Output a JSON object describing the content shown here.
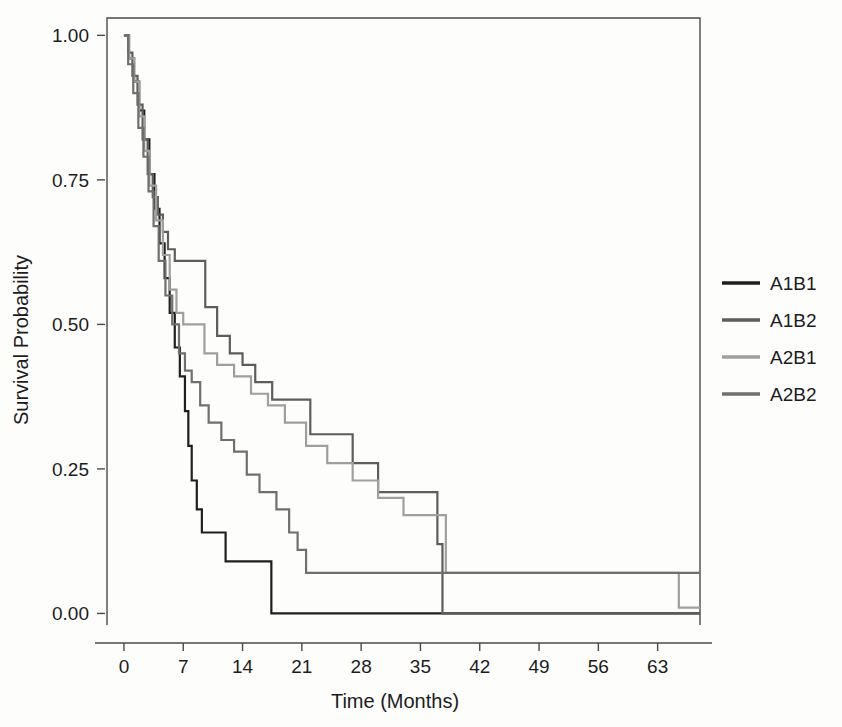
{
  "chart_data": {
    "type": "line",
    "subtype": "kaplan-meier-step",
    "title": "",
    "xlabel": "Time (Months)",
    "ylabel": "Survival Probability",
    "xlim": [
      -2,
      68
    ],
    "ylim": [
      -0.02,
      1.03
    ],
    "xticks": [
      0,
      7,
      14,
      21,
      28,
      35,
      42,
      49,
      56,
      63
    ],
    "yticks": [
      0.0,
      0.25,
      0.5,
      0.75,
      1.0
    ],
    "ytick_labels": [
      "0.00",
      "0.25",
      "0.50",
      "0.75",
      "1.00"
    ],
    "xtick_labels": [
      "0",
      "7",
      "14",
      "21",
      "28",
      "35",
      "42",
      "49",
      "56",
      "63"
    ],
    "grid": false,
    "legend_position": "right",
    "series": [
      {
        "name": "A1B1",
        "color": "#1f1f1f",
        "points": [
          [
            0,
            1.0
          ],
          [
            0.6,
            0.96
          ],
          [
            1.2,
            0.92
          ],
          [
            1.8,
            0.87
          ],
          [
            2.4,
            0.82
          ],
          [
            3.0,
            0.76
          ],
          [
            3.6,
            0.7
          ],
          [
            4.2,
            0.64
          ],
          [
            4.8,
            0.58
          ],
          [
            5.4,
            0.52
          ],
          [
            6.0,
            0.46
          ],
          [
            6.6,
            0.41
          ],
          [
            7.2,
            0.35
          ],
          [
            7.6,
            0.29
          ],
          [
            8.0,
            0.23
          ],
          [
            8.6,
            0.18
          ],
          [
            9.2,
            0.14
          ],
          [
            11.5,
            0.14
          ],
          [
            12.0,
            0.09
          ],
          [
            17.0,
            0.09
          ],
          [
            17.4,
            0.0
          ],
          [
            68,
            0.0
          ]
        ]
      },
      {
        "name": "A1B2",
        "color": "#5d5d5d",
        "points": [
          [
            0,
            1.0
          ],
          [
            0.5,
            0.97
          ],
          [
            1.0,
            0.93
          ],
          [
            1.6,
            0.88
          ],
          [
            2.2,
            0.82
          ],
          [
            2.8,
            0.76
          ],
          [
            3.4,
            0.72
          ],
          [
            4.0,
            0.69
          ],
          [
            4.6,
            0.66
          ],
          [
            5.2,
            0.63
          ],
          [
            6.0,
            0.61
          ],
          [
            9.0,
            0.61
          ],
          [
            9.6,
            0.53
          ],
          [
            11.0,
            0.48
          ],
          [
            12.5,
            0.45
          ],
          [
            14.0,
            0.43
          ],
          [
            15.5,
            0.4
          ],
          [
            17.5,
            0.37
          ],
          [
            21.0,
            0.37
          ],
          [
            22.0,
            0.31
          ],
          [
            26.0,
            0.31
          ],
          [
            27.0,
            0.26
          ],
          [
            30.0,
            0.21
          ],
          [
            36.5,
            0.21
          ],
          [
            37.0,
            0.12
          ],
          [
            37.6,
            0.0
          ],
          [
            68,
            0.0
          ]
        ]
      },
      {
        "name": "A2B1",
        "color": "#9f9f9f",
        "points": [
          [
            0,
            1.0
          ],
          [
            0.6,
            0.96
          ],
          [
            1.2,
            0.92
          ],
          [
            1.8,
            0.86
          ],
          [
            2.4,
            0.8
          ],
          [
            3.0,
            0.74
          ],
          [
            3.8,
            0.68
          ],
          [
            4.6,
            0.62
          ],
          [
            5.4,
            0.56
          ],
          [
            6.2,
            0.52
          ],
          [
            7.0,
            0.5
          ],
          [
            8.5,
            0.5
          ],
          [
            9.5,
            0.45
          ],
          [
            11.0,
            0.43
          ],
          [
            13.0,
            0.41
          ],
          [
            15.0,
            0.38
          ],
          [
            17.0,
            0.36
          ],
          [
            19.0,
            0.33
          ],
          [
            21.5,
            0.29
          ],
          [
            24.0,
            0.26
          ],
          [
            27.0,
            0.23
          ],
          [
            30.0,
            0.2
          ],
          [
            33.0,
            0.17
          ],
          [
            37.5,
            0.17
          ],
          [
            38.0,
            0.07
          ],
          [
            65.0,
            0.07
          ],
          [
            65.5,
            0.01
          ],
          [
            68,
            0.01
          ]
        ]
      },
      {
        "name": "A2B2",
        "color": "#6f6f6f",
        "points": [
          [
            0,
            1.0
          ],
          [
            0.5,
            0.95
          ],
          [
            1.1,
            0.9
          ],
          [
            1.7,
            0.84
          ],
          [
            2.3,
            0.79
          ],
          [
            2.9,
            0.73
          ],
          [
            3.5,
            0.67
          ],
          [
            4.1,
            0.61
          ],
          [
            4.9,
            0.55
          ],
          [
            5.7,
            0.5
          ],
          [
            6.5,
            0.45
          ],
          [
            7.2,
            0.42
          ],
          [
            8.0,
            0.4
          ],
          [
            9.0,
            0.36
          ],
          [
            10.0,
            0.33
          ],
          [
            11.5,
            0.3
          ],
          [
            13.0,
            0.28
          ],
          [
            14.5,
            0.24
          ],
          [
            16.0,
            0.21
          ],
          [
            18.0,
            0.18
          ],
          [
            19.5,
            0.14
          ],
          [
            20.5,
            0.11
          ],
          [
            21.5,
            0.07
          ],
          [
            68,
            0.07
          ]
        ]
      }
    ]
  },
  "legend": {
    "entries": [
      {
        "label": "A1B1",
        "color": "#1f1f1f"
      },
      {
        "label": "A1B2",
        "color": "#5d5d5d"
      },
      {
        "label": "A2B1",
        "color": "#9f9f9f"
      },
      {
        "label": "A2B2",
        "color": "#6f6f6f"
      }
    ]
  },
  "axes": {
    "x_title": "Time (Months)",
    "y_title": "Survival Probability"
  }
}
